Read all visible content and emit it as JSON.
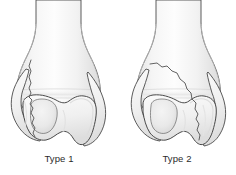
{
  "figure": {
    "background_color": "#ffffff",
    "outline_color": "#4a4a4a",
    "fracture_line_color": "#5a5a5a",
    "bone_fill_light": "#fcfcfc",
    "bone_fill_mid": "#eeeeee",
    "bone_fill_shadow": "#d8d8d8",
    "caption_color": "#2b2b2b",
    "panels": [
      {
        "id": "panel-type-1",
        "caption": "Type 1",
        "subject": "distal humerus",
        "view": "anterior",
        "fracture_pattern": "vertical medial condylar split",
        "fracture_description": "Near-vertical fracture line descending along the medial column through the trochlea",
        "parts": [
          "humeral shaft",
          "medial epicondyle",
          "lateral epicondyle",
          "trochlea",
          "capitellum",
          "olecranon fossa"
        ]
      },
      {
        "id": "panel-type-2",
        "caption": "Type 2",
        "subject": "distal humerus",
        "view": "anterior",
        "fracture_pattern": "oblique lateral condylar split",
        "fracture_description": "Oblique fracture line running from the medial supracondylar ridge down and laterally through the capitellum",
        "parts": [
          "humeral shaft",
          "medial epicondyle",
          "lateral epicondyle",
          "trochlea",
          "capitellum",
          "olecranon fossa"
        ]
      }
    ]
  }
}
